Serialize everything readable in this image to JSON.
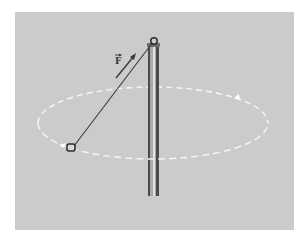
{
  "diagram": {
    "force_label": "F",
    "force_vector_arrow": "→",
    "colors": {
      "background": "#cbcbcb",
      "page": "#ffffff",
      "string": "#3a3a3a",
      "pole": "#555555",
      "pole_highlight": "#d8d8d8",
      "path": "#f2f2f2",
      "ball": "#2e2e2e"
    },
    "path": {
      "cx": 153,
      "cy": 123,
      "rx": 115,
      "ry": 36,
      "style": "dashed"
    },
    "pole": {
      "x": 148,
      "top": 43,
      "bottom": 196
    },
    "pivot": {
      "x": 154,
      "y": 42
    },
    "ball": {
      "x": 71,
      "y": 148
    }
  }
}
